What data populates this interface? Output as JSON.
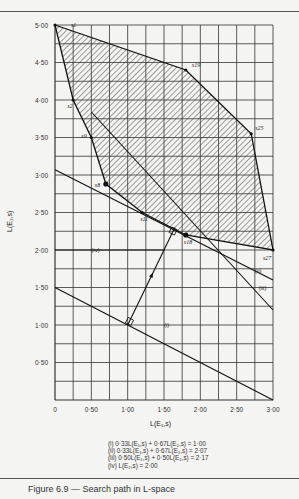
{
  "chart_data": {
    "type": "line",
    "title": "",
    "xlabel": "L(E1,s)",
    "ylabel": "L(E2,s)",
    "xlim": [
      0,
      3.0
    ],
    "ylim": [
      0,
      5.0
    ],
    "grid": true,
    "grid_step": 0.25,
    "x_ticks": [
      "0",
      "0·50",
      "1·00",
      "1·50",
      "2·00",
      "2·50",
      "3·00"
    ],
    "y_ticks": [
      "0·50",
      "1·00",
      "1·50",
      "2·00",
      "2·50",
      "3·00",
      "3·50",
      "4·00",
      "4·50",
      "5·00"
    ],
    "feasible_region": {
      "fill": "hatched",
      "vertices": [
        {
          "label": "s1",
          "x": 0.0,
          "y": 5.0
        },
        {
          "label": "s19",
          "x": 1.8,
          "y": 4.4
        },
        {
          "label": "s25",
          "x": 2.7,
          "y": 3.55
        },
        {
          "label": "s27",
          "x": 3.0,
          "y": 2.0
        },
        {
          "label": "s18",
          "x": 1.8,
          "y": 2.2
        },
        {
          "label": "s11",
          "x": 1.2,
          "y": 2.5
        },
        {
          "label": "s8",
          "x": 0.7,
          "y": 2.88
        },
        {
          "label": "s9",
          "x": 0.5,
          "y": 3.5
        },
        {
          "label": "s2",
          "x": 0.25,
          "y": 4.0
        }
      ]
    },
    "lines": [
      {
        "label": "(i)",
        "equation": "0·33L(E1,s) + 0·67L(E2,s) = 1·00",
        "points": [
          [
            0,
            1.5
          ],
          [
            3.0,
            0.0
          ]
        ]
      },
      {
        "label": "(ii)",
        "equation": "0·33L(E1,s) + 0·67L(E2,s) = 2·07",
        "points": [
          [
            0,
            3.07
          ],
          [
            3.0,
            1.6
          ]
        ]
      },
      {
        "label": "(iii)",
        "equation": "0·50L(E1,s) + 0·50L(E2,s) = 2·17",
        "points": [
          [
            0.5,
            3.84
          ],
          [
            3.0,
            1.2
          ]
        ]
      },
      {
        "label": "(iv)",
        "equation": "L(E2,s) = 2·00",
        "points": [
          [
            0,
            2.0
          ],
          [
            1.5,
            2.0
          ]
        ]
      }
    ],
    "arrow": {
      "from": [
        1.0,
        1.0
      ],
      "to": [
        1.65,
        2.3
      ]
    }
  },
  "legend": {
    "items": [
      "(i) 0·33L(E₁,s) + 0·67L(E₂,s) = 1·00",
      "(ii) 0·33L(E₁,s) + 0·67L(E₂,s) = 2·07",
      "(iii) 0·50L(E₁,s) + 0·50L(E₂,s) = 2·17",
      "(iv) L(E₂,s) = 2·00"
    ]
  },
  "axes": {
    "xlabel": "L(E₁,s)",
    "ylabel": "L(E₂,s)"
  },
  "caption": "Figure 6.9 — Search path in L-space"
}
